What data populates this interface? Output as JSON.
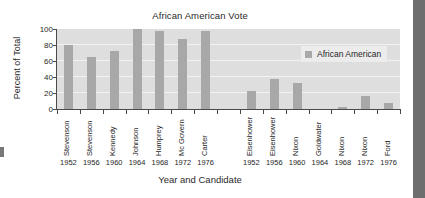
{
  "chart_data": {
    "type": "bar",
    "title": "African American Vote",
    "xlabel": "Year and Candidate",
    "ylabel": "Percent of Total",
    "ylim": [
      0,
      100
    ],
    "yticks": [
      0,
      20,
      40,
      60,
      80,
      100
    ],
    "grid": true,
    "legend": {
      "position": "inside-top-right",
      "entries": [
        {
          "label": "African American",
          "color": "#a8a8a8"
        }
      ]
    },
    "categories": [
      "Stevenson 1952",
      "Stevenson 1956",
      "Kennedy 1960",
      "Johnson 1964",
      "Humprey 1968",
      "Mc Govern 1972",
      "Carter 1976",
      "",
      "Eisenhower 1952",
      "Eisenhower 1956",
      "Nixon 1960",
      "Goldwater 1964",
      "Nixon 1968",
      "Nixon 1972",
      "Ford 1976"
    ],
    "candidates": [
      "Stevenson",
      "Stevenson",
      "Kennedy",
      "Johnson",
      "Humprey",
      "Mc Govern",
      "Carter",
      "",
      "Eisenhower",
      "Eisenhower",
      "Nixon",
      "Goldwater",
      "Nixon",
      "Nixon",
      "Ford"
    ],
    "years": [
      "1952",
      "1956",
      "1960",
      "1964",
      "1968",
      "1972",
      "1976",
      "",
      "1952",
      "1956",
      "1960",
      "1964",
      "1968",
      "1972",
      "1976"
    ],
    "values": [
      80,
      65,
      73,
      100,
      98,
      88,
      98,
      null,
      22,
      38,
      32,
      0,
      3,
      16,
      7
    ],
    "series": [
      {
        "name": "African American",
        "color": "#a8a8a8",
        "values": [
          80,
          65,
          73,
          100,
          98,
          88,
          98,
          null,
          22,
          38,
          32,
          0,
          3,
          16,
          7
        ]
      }
    ],
    "colors": {
      "bar": "#a8a8a8",
      "plot_background": "#dedede",
      "gridline": "#f2f2f2",
      "axis": "#4a4a4a",
      "text": "#1a1a1a",
      "page_background": "#ffffff",
      "scan_edge": "#6e6e6e"
    }
  }
}
